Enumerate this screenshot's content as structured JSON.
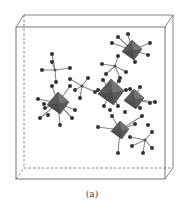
{
  "figure": {
    "caption": "(a)",
    "colors": {
      "box": "#666666",
      "polyhedron": "#5a5a5a",
      "polyhedron_light": "#7a7a7a",
      "bond": "#8a8a8a",
      "atom": "#333333"
    },
    "box": {
      "front": {
        "x1": 16,
        "y1": 27,
        "x2": 165,
        "y2": 179
      },
      "back": {
        "x1": 24,
        "y1": 15,
        "x2": 173,
        "y2": 168
      }
    },
    "polyhedra": [
      {
        "cx": 132,
        "cy": 50,
        "size": 10
      },
      {
        "cx": 111,
        "cy": 92,
        "size": 13
      },
      {
        "cx": 134,
        "cy": 99,
        "size": 10
      },
      {
        "cx": 58,
        "cy": 103,
        "size": 11
      },
      {
        "cx": 120,
        "cy": 130,
        "size": 9
      }
    ],
    "centers": [
      {
        "x": 55,
        "y": 70
      },
      {
        "x": 82,
        "y": 86
      },
      {
        "x": 115,
        "y": 66
      },
      {
        "x": 145,
        "y": 140
      },
      {
        "x": 58,
        "y": 103
      },
      {
        "x": 132,
        "y": 50
      },
      {
        "x": 111,
        "y": 92
      },
      {
        "x": 134,
        "y": 99
      },
      {
        "x": 120,
        "y": 130
      }
    ],
    "bonds": [
      [
        55,
        70,
        52,
        54
      ],
      [
        55,
        70,
        42,
        70
      ],
      [
        55,
        70,
        70,
        68
      ],
      [
        55,
        70,
        56,
        82
      ],
      [
        55,
        70,
        52,
        62
      ],
      [
        82,
        86,
        70,
        79
      ],
      [
        82,
        86,
        88,
        78
      ],
      [
        82,
        86,
        80,
        98
      ],
      [
        82,
        86,
        95,
        92
      ],
      [
        82,
        86,
        75,
        90
      ],
      [
        115,
        66,
        102,
        64
      ],
      [
        115,
        66,
        126,
        72
      ],
      [
        115,
        66,
        118,
        56
      ],
      [
        115,
        66,
        106,
        74
      ],
      [
        115,
        66,
        120,
        78
      ],
      [
        132,
        50,
        112,
        43
      ],
      [
        132,
        50,
        118,
        37
      ],
      [
        132,
        50,
        150,
        43
      ],
      [
        132,
        50,
        148,
        55
      ],
      [
        132,
        50,
        135,
        62
      ],
      [
        132,
        50,
        128,
        34
      ],
      [
        58,
        103,
        38,
        99
      ],
      [
        58,
        103,
        40,
        118
      ],
      [
        58,
        103,
        52,
        86
      ],
      [
        58,
        103,
        70,
        86
      ],
      [
        58,
        103,
        75,
        110
      ],
      [
        58,
        103,
        60,
        125
      ],
      [
        58,
        103,
        45,
        108
      ],
      [
        58,
        103,
        72,
        118
      ],
      [
        111,
        92,
        98,
        90
      ],
      [
        111,
        92,
        103,
        80
      ],
      [
        111,
        92,
        104,
        106
      ],
      [
        111,
        92,
        126,
        90
      ],
      [
        111,
        92,
        119,
        81
      ],
      [
        111,
        92,
        118,
        106
      ],
      [
        134,
        99,
        130,
        89
      ],
      [
        134,
        99,
        150,
        103
      ],
      [
        134,
        99,
        140,
        87
      ],
      [
        134,
        99,
        140,
        108
      ],
      [
        134,
        99,
        155,
        102
      ],
      [
        120,
        130,
        98,
        127
      ],
      [
        120,
        130,
        112,
        116
      ],
      [
        120,
        130,
        135,
        124
      ],
      [
        120,
        130,
        118,
        153
      ],
      [
        120,
        130,
        142,
        116
      ],
      [
        145,
        140,
        130,
        137
      ],
      [
        145,
        140,
        152,
        132
      ],
      [
        145,
        140,
        152,
        148
      ],
      [
        145,
        140,
        143,
        153
      ],
      [
        145,
        140,
        132,
        146
      ]
    ],
    "atoms": [
      [
        52,
        54
      ],
      [
        42,
        70
      ],
      [
        70,
        68
      ],
      [
        56,
        82
      ],
      [
        52,
        62
      ],
      [
        70,
        79
      ],
      [
        88,
        78
      ],
      [
        80,
        98
      ],
      [
        95,
        92
      ],
      [
        75,
        90
      ],
      [
        102,
        64
      ],
      [
        126,
        72
      ],
      [
        118,
        56
      ],
      [
        106,
        74
      ],
      [
        120,
        78
      ],
      [
        112,
        43
      ],
      [
        118,
        37
      ],
      [
        150,
        43
      ],
      [
        148,
        55
      ],
      [
        135,
        62
      ],
      [
        128,
        34
      ],
      [
        38,
        99
      ],
      [
        40,
        118
      ],
      [
        52,
        86
      ],
      [
        70,
        86
      ],
      [
        75,
        110
      ],
      [
        60,
        125
      ],
      [
        45,
        108
      ],
      [
        72,
        118
      ],
      [
        48,
        115
      ],
      [
        44,
        104
      ],
      [
        98,
        90
      ],
      [
        103,
        80
      ],
      [
        104,
        106
      ],
      [
        126,
        90
      ],
      [
        119,
        81
      ],
      [
        118,
        106
      ],
      [
        130,
        89
      ],
      [
        150,
        103
      ],
      [
        140,
        87
      ],
      [
        140,
        108
      ],
      [
        155,
        102
      ],
      [
        98,
        127
      ],
      [
        112,
        116
      ],
      [
        135,
        124
      ],
      [
        118,
        153
      ],
      [
        142,
        116
      ],
      [
        130,
        137
      ],
      [
        152,
        132
      ],
      [
        152,
        148
      ],
      [
        143,
        153
      ],
      [
        132,
        146
      ],
      [
        148,
        125
      ],
      [
        125,
        112
      ],
      [
        110,
        110
      ]
    ]
  }
}
